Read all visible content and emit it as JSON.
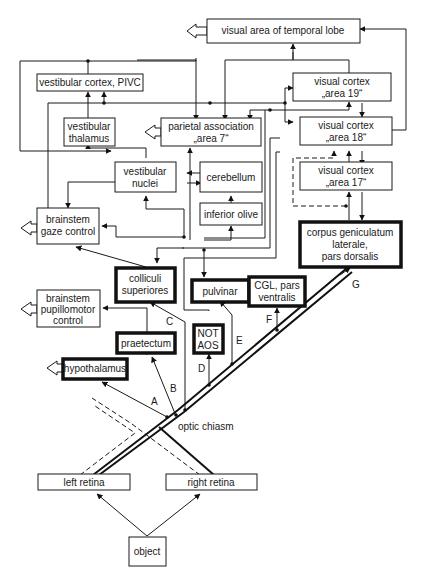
{
  "diagram": {
    "nodes": {
      "temporal": {
        "label": "visual area of temporal lobe"
      },
      "pivc": {
        "label": "vestibular cortex, PIVC"
      },
      "v19": {
        "line1": "visual cortex",
        "line2": "„area 19“"
      },
      "vthal": {
        "line1": "vestibular",
        "line2": "thalamus"
      },
      "parietal": {
        "line1": "parietal association",
        "line2": "„area 7“"
      },
      "v18": {
        "line1": "visual cortex",
        "line2": "„area 18“"
      },
      "vnuc": {
        "line1": "vestibular",
        "line2": "nuclei"
      },
      "cereb": {
        "label": "cerebellum"
      },
      "v17": {
        "line1": "visual cortex",
        "line2": "„area 17“"
      },
      "olive": {
        "label": "inferior olive"
      },
      "gaze": {
        "line1": "brainstem",
        "line2": "gaze control"
      },
      "cgl_d": {
        "line1": "corpus geniculatum",
        "line2": "laterale,",
        "line3": "pars dorsalis"
      },
      "colliculi": {
        "line1": "colliculi",
        "line2": "superiores"
      },
      "pulvinar": {
        "label": "pulvinar"
      },
      "cgl_v": {
        "line1": "CGL, pars",
        "line2": "ventralis"
      },
      "pupillo": {
        "line1": "brainstem",
        "line2": "pupillomotor",
        "line3": "control"
      },
      "praetectum": {
        "label": "praetectum"
      },
      "not_aos": {
        "line1": "NOT",
        "line2": "AOS"
      },
      "hypothalamus": {
        "label": "hypothalamus"
      },
      "chiasm": {
        "label": "optic chiasm"
      },
      "left_retina": {
        "label": "left retina"
      },
      "right_retina": {
        "label": "right retina"
      },
      "object": {
        "label": "object"
      }
    },
    "pathway_labels": {
      "A": "A",
      "B": "B",
      "C": "C",
      "D": "D",
      "E": "E",
      "F": "F",
      "G": "G"
    },
    "legend": {
      "bold_boxes": "retinal target nuclei",
      "dashed_lines": "ipsilateral projections"
    }
  }
}
